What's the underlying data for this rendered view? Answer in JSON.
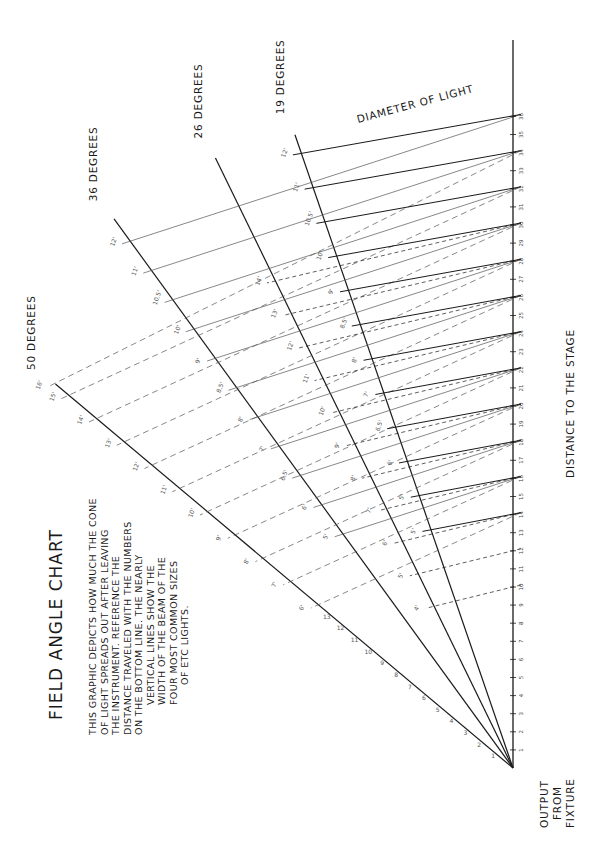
{
  "title": "FIELD ANGLE CHART",
  "description_lines": [
    "THIS GRAPHIC DEPICTS HOW MUCH THE CONE",
    "OF LIGHT SPREADS OUT AFTER LEAVING",
    "THE INSTRUMENT.  REFERENCE THE",
    "DISTANCE TRAVELED WITH THE NUMBERS",
    "ON THE BOTTOM LINE.  THE NEARLY",
    "VERTICAL LINES SHOW THE",
    "WIDTH OF THE BEAM OF THE",
    "FOUR MOST COMMON SIZES",
    "OF ETC LIGHTS."
  ],
  "labels": {
    "origin": [
      "OUTPUT",
      "FROM",
      "FIXTURE"
    ],
    "axis": "DISTANCE TO THE STAGE",
    "diameter": "DIAMETER OF LIGHT"
  },
  "colors": {
    "ink": "#1a1a1a",
    "faint": "#555555",
    "paper": "#ffffff"
  },
  "chart_data": {
    "type": "line",
    "title": "FIELD ANGLE CHART",
    "xlabel": "DISTANCE TO THE STAGE",
    "ylabel": "DIAMETER OF LIGHT",
    "units": "feet",
    "orientation": "rotated 90deg counter-clockwise; fixture at bottom right, distance increases upward",
    "distance_ticks": [
      1,
      2,
      3,
      4,
      5,
      6,
      7,
      8,
      9,
      10,
      11,
      12,
      13,
      14,
      15,
      16,
      17,
      18,
      19,
      20,
      21,
      22,
      23,
      24,
      25,
      26,
      27,
      28,
      29,
      30,
      31,
      32,
      33,
      34,
      35,
      36
    ],
    "xlim": [
      0,
      36
    ],
    "series": [
      {
        "name": "50 DEGREES",
        "angle": 50,
        "length_ft": 33,
        "diameter_labels": [
          {
            "distance": 14,
            "diameter": 6
          },
          {
            "distance": 16,
            "diameter": 7
          },
          {
            "distance": 18,
            "diameter": 8
          },
          {
            "distance": 20,
            "diameter": 9
          },
          {
            "distance": 22,
            "diameter": 10
          },
          {
            "distance": 24,
            "diameter": 11
          },
          {
            "distance": 26,
            "diameter": 12
          },
          {
            "distance": 28,
            "diameter": 13
          },
          {
            "distance": 30,
            "diameter": 14
          },
          {
            "distance": 32,
            "diameter": 15
          },
          {
            "distance": 34,
            "diameter": 16
          }
        ]
      },
      {
        "name": "36 DEGREES",
        "angle": 36,
        "length_ft": 37.5,
        "diameter_labels": [
          {
            "distance": 16,
            "diameter": 5
          },
          {
            "distance": 18,
            "diameter": 6
          },
          {
            "distance": 20,
            "diameter": 6.5
          },
          {
            "distance": 22,
            "diameter": 7
          },
          {
            "distance": 24,
            "diameter": 8
          },
          {
            "distance": 26,
            "diameter": 8.5
          },
          {
            "distance": 28,
            "diameter": 9
          },
          {
            "distance": 30,
            "diameter": 10
          },
          {
            "distance": 32,
            "diameter": 10.5
          },
          {
            "distance": 34,
            "diameter": 11
          },
          {
            "distance": 36,
            "diameter": 12
          },
          {
            "distance": 38,
            "diameter": 12.5
          },
          {
            "distance": 40,
            "diameter": 13
          },
          {
            "distance": 42,
            "diameter": 14
          }
        ]
      },
      {
        "name": "26 DEGREES",
        "angle": 26,
        "length_ft": 37.5,
        "diameter_labels": [
          {
            "distance": 10,
            "diameter": 4
          },
          {
            "distance": 12,
            "diameter": 5
          },
          {
            "distance": 14,
            "diameter": 6
          },
          {
            "distance": 16,
            "diameter": 7
          },
          {
            "distance": 18,
            "diameter": 8
          },
          {
            "distance": 20,
            "diameter": 9
          },
          {
            "distance": 22,
            "diameter": 10
          },
          {
            "distance": 24,
            "diameter": 11
          },
          {
            "distance": 26,
            "diameter": 12
          },
          {
            "distance": 28,
            "diameter": 13
          },
          {
            "distance": 30,
            "diameter": 14
          }
        ]
      },
      {
        "name": "19 DEGREES",
        "angle": 19,
        "length_ft": 37,
        "diameter_labels": [
          {
            "distance": 14,
            "diameter": 5
          },
          {
            "distance": 16,
            "diameter": 5
          },
          {
            "distance": 18,
            "diameter": 6
          },
          {
            "distance": 20,
            "diameter": 6.5
          },
          {
            "distance": 22,
            "diameter": 7
          },
          {
            "distance": 24,
            "diameter": 8
          },
          {
            "distance": 26,
            "diameter": 8.5
          },
          {
            "distance": 28,
            "diameter": 9
          },
          {
            "distance": 30,
            "diameter": 10
          },
          {
            "distance": 32,
            "diameter": 10.5
          },
          {
            "distance": 34,
            "diameter": 11
          },
          {
            "distance": 36,
            "diameter": 12
          }
        ]
      }
    ],
    "grid": false,
    "legend": "labels at line ends"
  }
}
